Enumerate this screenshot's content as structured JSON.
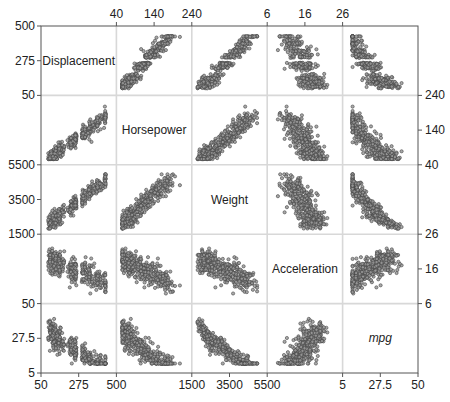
{
  "chart_data": {
    "type": "scatter_matrix",
    "title": "",
    "variables": [
      {
        "name": "Displacement",
        "italic": false,
        "range": [
          50,
          500
        ],
        "ticks": [
          "50",
          "275",
          "500"
        ],
        "tick_values": [
          50,
          275,
          500
        ]
      },
      {
        "name": "Horsepower",
        "italic": false,
        "range": [
          40,
          240
        ],
        "ticks": [
          "40",
          "140",
          "240"
        ],
        "tick_values": [
          40,
          140,
          240
        ]
      },
      {
        "name": "Weight",
        "italic": false,
        "range": [
          1500,
          5500
        ],
        "ticks": [
          "1500",
          "3500",
          "5500"
        ],
        "tick_values": [
          1500,
          3500,
          5500
        ]
      },
      {
        "name": "Acceleration",
        "italic": false,
        "range": [
          6,
          26
        ],
        "ticks": [
          "6",
          "16",
          "26"
        ],
        "tick_values": [
          6,
          16,
          26
        ]
      },
      {
        "name": "mpg",
        "italic": true,
        "range": [
          5,
          50
        ],
        "ticks": [
          "5",
          "27.5",
          "50"
        ],
        "tick_values": [
          5,
          27.5,
          50
        ]
      }
    ],
    "axis_placement": {
      "top": [
        1,
        3
      ],
      "bottom": [
        0,
        2,
        4
      ],
      "left": [
        0,
        2,
        4
      ],
      "right": [
        1,
        3
      ]
    },
    "grid": true,
    "legend": "none",
    "n_points_approx": 392,
    "correlations_approx": {
      "Displacement-Horsepower": 0.9,
      "Displacement-Weight": 0.93,
      "Displacement-Acceleration": -0.54,
      "Displacement-mpg": -0.81,
      "Horsepower-Weight": 0.86,
      "Horsepower-Acceleration": -0.69,
      "Horsepower-mpg": -0.78,
      "Weight-Acceleration": -0.42,
      "Weight-mpg": -0.83,
      "Acceleration-mpg": 0.42
    },
    "marker": {
      "shape": "circle",
      "fill": "#9a9a9a",
      "stroke": "#444444",
      "radius": 1.6
    }
  },
  "layout": {
    "plot_left": 41,
    "plot_top": 26,
    "cell_width": 75.4,
    "cell_height": 69.4,
    "frame_color": "#555555",
    "grid_color": "#d8d8d8"
  }
}
